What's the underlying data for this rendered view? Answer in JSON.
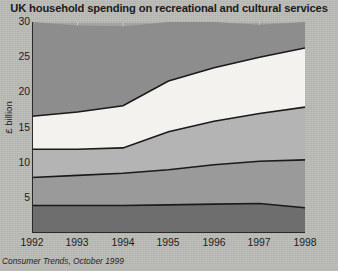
{
  "chart_data": {
    "type": "area",
    "title": "UK household spending on recreational and cultural services",
    "xlabel": "",
    "ylabel": "£ billion",
    "source": "Consumer Trends, October 1999",
    "x": [
      1992,
      1993,
      1994,
      1995,
      1996,
      1997,
      1998
    ],
    "categories": [
      "1992",
      "1993",
      "1994",
      "1995",
      "1996",
      "1997",
      "1998"
    ],
    "xlim": [
      1992,
      1998
    ],
    "ylim": [
      0,
      30
    ],
    "yticks": [
      0,
      5,
      10,
      15,
      20,
      25,
      30
    ],
    "ytick_labels": [
      "",
      "5",
      "10",
      "15",
      "20",
      "25",
      "30"
    ],
    "grid": true,
    "grid_color": "#c8c8c4",
    "stacked": true,
    "series": [
      {
        "name": "band-1",
        "color": "#6e6e6e",
        "values": [
          3.9,
          3.9,
          3.9,
          4.0,
          4.1,
          4.2,
          3.6
        ]
      },
      {
        "name": "band-2",
        "color": "#9a9a9a",
        "values": [
          4.0,
          4.3,
          4.6,
          5.0,
          5.6,
          6.0,
          6.8
        ]
      },
      {
        "name": "band-3",
        "color": "#b4b4b4",
        "values": [
          4.0,
          3.7,
          3.6,
          5.4,
          6.2,
          6.8,
          7.5
        ]
      },
      {
        "name": "band-4",
        "color": "#f4f2ee",
        "values": [
          4.7,
          5.3,
          6.0,
          7.2,
          7.6,
          8.0,
          8.4
        ]
      },
      {
        "name": "band-5",
        "color": "#8d8d8d",
        "values": [
          13.4,
          12.3,
          11.3,
          8.4,
          6.5,
          4.6,
          3.7
        ]
      }
    ],
    "stack_tops": {
      "band-1": [
        3.9,
        3.9,
        3.9,
        4.0,
        4.1,
        4.2,
        3.6
      ],
      "band-2": [
        7.9,
        8.2,
        8.5,
        9.0,
        9.7,
        10.2,
        10.4
      ],
      "band-3": [
        11.9,
        11.9,
        12.1,
        14.4,
        15.9,
        17.0,
        17.9
      ],
      "band-4": [
        16.6,
        17.2,
        18.1,
        21.6,
        23.5,
        25.0,
        26.3
      ],
      "band-5": [
        30.0,
        29.5,
        29.4,
        30.0,
        30.0,
        29.6,
        30.0
      ]
    },
    "line_color": "#1a1a1a",
    "plot_bg": "#a3a3a3"
  }
}
